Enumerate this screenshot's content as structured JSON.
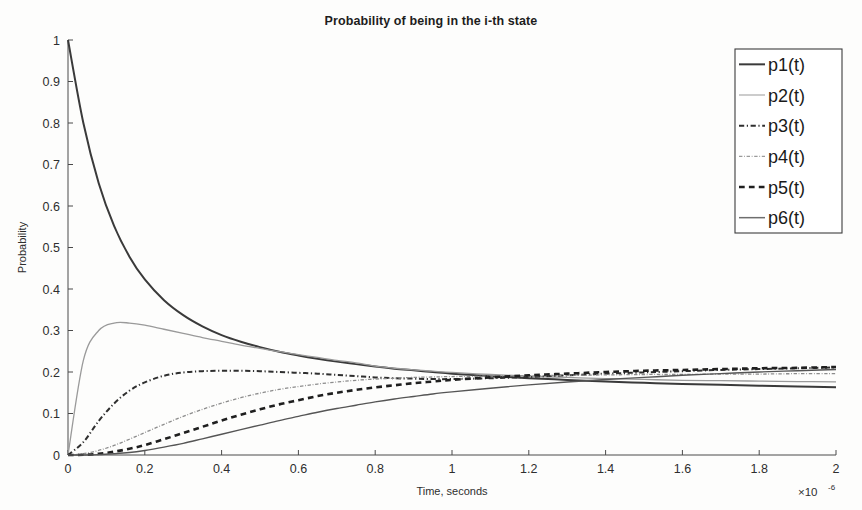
{
  "chart_data": {
    "type": "line",
    "title": "Probability of being in the i-th state",
    "xlabel": "Time, seconds",
    "ylabel": "Probability",
    "x_exponent_label": "×10",
    "x_exponent_sup": "-6",
    "xlim": [
      0,
      2
    ],
    "ylim": [
      0,
      1
    ],
    "xticks": [
      0,
      0.2,
      0.4,
      0.6,
      0.8,
      1,
      1.2,
      1.4,
      1.6,
      1.8,
      2
    ],
    "xtick_labels": [
      "0",
      "0.2",
      "0.4",
      "0.6",
      "0.8",
      "1",
      "1.2",
      "1.4",
      "1.6",
      "1.8",
      "2"
    ],
    "yticks": [
      0,
      0.1,
      0.2,
      0.3,
      0.4,
      0.5,
      0.6,
      0.7,
      0.8,
      0.9,
      1
    ],
    "ytick_labels": [
      "0",
      "0.1",
      "0.2",
      "0.3",
      "0.4",
      "0.5",
      "0.6",
      "0.7",
      "0.8",
      "0.9",
      "1"
    ],
    "grid": false,
    "legend_position": "top-right",
    "x": [
      0,
      0.04,
      0.08,
      0.12,
      0.16,
      0.2,
      0.25,
      0.3,
      0.35,
      0.4,
      0.45,
      0.5,
      0.55,
      0.6,
      0.65,
      0.7,
      0.75,
      0.8,
      0.85,
      0.9,
      0.95,
      1.0,
      1.1,
      1.2,
      1.3,
      1.4,
      1.5,
      1.6,
      1.7,
      1.8,
      1.9,
      2.0
    ],
    "series": [
      {
        "name": "p1(t)",
        "style": "solid",
        "color": "#3a3a3a",
        "width": 2.0,
        "values": [
          1.0,
          0.8,
          0.655,
          0.552,
          0.478,
          0.423,
          0.373,
          0.337,
          0.31,
          0.289,
          0.273,
          0.26,
          0.249,
          0.24,
          0.232,
          0.225,
          0.219,
          0.213,
          0.208,
          0.204,
          0.2,
          0.196,
          0.19,
          0.185,
          0.181,
          0.177,
          0.174,
          0.171,
          0.169,
          0.167,
          0.165,
          0.163
        ]
      },
      {
        "name": "p2(t)",
        "style": "solid",
        "color": "#9a9a9a",
        "width": 1.3,
        "values": [
          0.0,
          0.228,
          0.3,
          0.318,
          0.318,
          0.313,
          0.303,
          0.293,
          0.283,
          0.274,
          0.265,
          0.257,
          0.249,
          0.242,
          0.235,
          0.228,
          0.222,
          0.214,
          0.209,
          0.205,
          0.202,
          0.199,
          0.194,
          0.19,
          0.187,
          0.184,
          0.182,
          0.18,
          0.179,
          0.178,
          0.177,
          0.176
        ]
      },
      {
        "name": "p3(t)",
        "style": "dashdot",
        "color": "#2f2f2f",
        "width": 2.0,
        "values": [
          0.0,
          0.031,
          0.082,
          0.124,
          0.155,
          0.175,
          0.191,
          0.199,
          0.202,
          0.203,
          0.203,
          0.202,
          0.2,
          0.198,
          0.196,
          0.193,
          0.19,
          0.187,
          0.185,
          0.184,
          0.183,
          0.183,
          0.185,
          0.188,
          0.192,
          0.196,
          0.199,
          0.202,
          0.205,
          0.207,
          0.209,
          0.211
        ]
      },
      {
        "name": "p4(t)",
        "style": "dashdot",
        "color": "#8c8c8c",
        "width": 1.3,
        "values": [
          0.0,
          0.003,
          0.011,
          0.023,
          0.038,
          0.054,
          0.074,
          0.093,
          0.11,
          0.125,
          0.138,
          0.149,
          0.158,
          0.165,
          0.171,
          0.176,
          0.18,
          0.183,
          0.185,
          0.187,
          0.188,
          0.189,
          0.19,
          0.191,
          0.192,
          0.193,
          0.194,
          0.194,
          0.195,
          0.195,
          0.196,
          0.196
        ]
      },
      {
        "name": "p5(t)",
        "style": "dashed",
        "color": "#1f1f1f",
        "width": 2.6,
        "values": [
          0.0,
          0.0005,
          0.003,
          0.008,
          0.015,
          0.024,
          0.038,
          0.053,
          0.068,
          0.083,
          0.097,
          0.11,
          0.122,
          0.132,
          0.142,
          0.15,
          0.157,
          0.163,
          0.168,
          0.173,
          0.177,
          0.181,
          0.187,
          0.192,
          0.196,
          0.2,
          0.203,
          0.205,
          0.207,
          0.209,
          0.21,
          0.212
        ]
      },
      {
        "name": "p6(t)",
        "style": "solid",
        "color": "#555555",
        "width": 1.4,
        "values": [
          0.0,
          0.0001,
          0.0008,
          0.003,
          0.006,
          0.011,
          0.019,
          0.028,
          0.039,
          0.05,
          0.061,
          0.072,
          0.083,
          0.093,
          0.103,
          0.112,
          0.12,
          0.128,
          0.135,
          0.141,
          0.147,
          0.152,
          0.161,
          0.169,
          0.176,
          0.182,
          0.187,
          0.192,
          0.196,
          0.2,
          0.203,
          0.206
        ]
      }
    ],
    "legend_entries": [
      {
        "label": "p1(t)",
        "style": "solid",
        "color": "#3a3a3a",
        "width": 2.0
      },
      {
        "label": "p2(t)",
        "style": "solid",
        "color": "#b0b0b0",
        "width": 1.3
      },
      {
        "label": "p3(t)",
        "style": "dashdot",
        "color": "#2f2f2f",
        "width": 2.0
      },
      {
        "label": "p4(t)",
        "style": "dashdot",
        "color": "#9a9a9a",
        "width": 1.3
      },
      {
        "label": "p5(t)",
        "style": "dashed",
        "color": "#1f1f1f",
        "width": 2.6
      },
      {
        "label": "p6(t)",
        "style": "solid",
        "color": "#6e6e6e",
        "width": 1.5
      }
    ]
  }
}
